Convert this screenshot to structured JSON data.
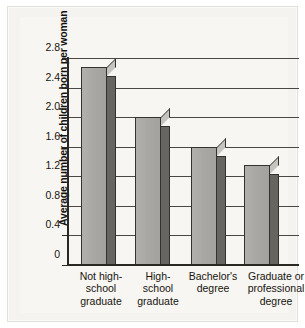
{
  "chart_data": {
    "type": "bar",
    "title": "",
    "xlabel": "",
    "ylabel": "Average number of children born per woman",
    "categories": [
      "Not high-school graduate",
      "High-school graduate",
      "Bachelor's degree",
      "Graduate or professional degree"
    ],
    "category_lines": [
      [
        "Not high-",
        "school",
        "graduate"
      ],
      [
        "High-",
        "school",
        "graduate"
      ],
      [
        "Bachelor's",
        "degree"
      ],
      [
        "Graduate or",
        "professional",
        "degree"
      ]
    ],
    "values": [
      2.68,
      2.0,
      1.59,
      1.35
    ],
    "ylim": [
      0,
      2.8
    ],
    "ytick_values": [
      0,
      0.4,
      0.8,
      1.2,
      1.6,
      2.0,
      2.4,
      2.8
    ],
    "ytick_labels": [
      "0",
      "0.4",
      "0.8",
      "1.2",
      "1.6",
      "2.0",
      "2.4",
      "2.8"
    ],
    "grid": true,
    "legend": "none",
    "series_name": "Average number of children born per woman"
  },
  "style": {
    "bar_face_color": "#a9a7a3",
    "bar_side_color": "#67655f",
    "bar_top_color": "#c6c4bf",
    "bar_outline_color": "#343230",
    "axis_color": "#2b2824",
    "gridline_color": "#4a4743",
    "plate_background": "#f4f3ef",
    "inner_background": "#f7f6f2",
    "text_color": "#17140f"
  }
}
